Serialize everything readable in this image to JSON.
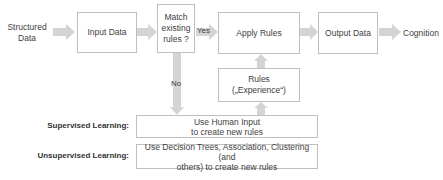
{
  "diagram": {
    "start_label": "Structured Data",
    "end_label": "Cognition",
    "nodes": {
      "input_data": "Input Data",
      "match_rules": "Match existing rules ?",
      "apply_rules": "Apply Rules",
      "output_data": "Output Data",
      "rules_line1": "Rules",
      "rules_line2": "(„Experience“)"
    },
    "edges": {
      "yes": "Yes",
      "no": "No"
    },
    "learning": [
      {
        "label": "Supervised Learning:",
        "line1": "Use Human Input",
        "line2": "to create new rules"
      },
      {
        "label": "Unsupervised Learning:",
        "line1": "Use Decision Trees, Association, Clustering (and",
        "line2": "others) to create new rules"
      }
    ],
    "colors": {
      "arrow": "#d4d4d4",
      "box_border": "#bfbfbf",
      "text": "#404040"
    }
  }
}
